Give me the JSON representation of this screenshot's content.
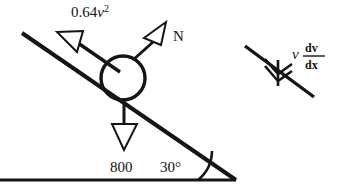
{
  "figure": {
    "background_color": "#ffffff",
    "ink_color": "#151515"
  },
  "labels": {
    "friction_force": "0.64",
    "friction_var": "v",
    "friction_exp": "2",
    "normal_force": "N",
    "weight": "800",
    "angle": "30°",
    "accel_var": "v",
    "accel_numerator": "dv",
    "accel_denominator": "dx"
  },
  "geometry": {
    "incline_start": [
      22,
      33
    ],
    "incline_end": [
      236,
      180
    ],
    "ground_start": [
      0,
      180
    ],
    "ground_end": [
      236,
      180
    ],
    "ball_center": [
      123,
      78
    ],
    "ball_radius": 22,
    "angle_degrees": 30,
    "aux_line_start": [
      245,
      46
    ],
    "aux_line_end": [
      314,
      97
    ]
  },
  "vectors": [
    {
      "name": "friction",
      "label": "0.64v²",
      "direction": "up-left-along-incline"
    },
    {
      "name": "normal",
      "label": "N",
      "direction": "up-right-perpendicular-to-incline"
    },
    {
      "name": "weight",
      "label": "800",
      "direction": "down-vertical"
    },
    {
      "name": "acceleration",
      "label": "v dv/dx",
      "direction": "down-left-along-incline"
    }
  ]
}
